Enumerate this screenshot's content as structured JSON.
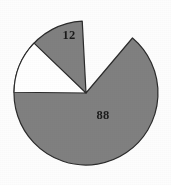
{
  "chart_data": {
    "type": "pie",
    "title": "",
    "subtitle": "",
    "xlabel": "",
    "ylabel": "",
    "legend": "none",
    "grid": false,
    "labels_shown": true,
    "label_position": "inside",
    "total": 100,
    "start_angle_deg": -3,
    "direction": "counterclockwise",
    "categories": [
      "88",
      "12"
    ],
    "values": [
      88,
      12
    ],
    "colors": [
      "#808080",
      "#ffffff"
    ],
    "slices": [
      {
        "name": "major-slice",
        "label": "88",
        "value": 88,
        "percent": 88,
        "color": "#808080",
        "start_angle_deg": -3,
        "sweep_angle_deg": 316.8,
        "label_x": 103,
        "label_y": 116
      },
      {
        "name": "minor-slice",
        "label": "12",
        "value": 12,
        "percent": 12,
        "color": "#ffffff",
        "start_angle_deg": -46.2,
        "sweep_angle_deg": 43.2,
        "label_x": 69,
        "label_y": 36
      }
    ],
    "geometry": {
      "center_x": 86,
      "center_y": 93,
      "radius": 72
    },
    "style": {
      "outline_color": "#2b2b2b",
      "outline_width": 1.2,
      "background": "#fdfdfd"
    }
  }
}
